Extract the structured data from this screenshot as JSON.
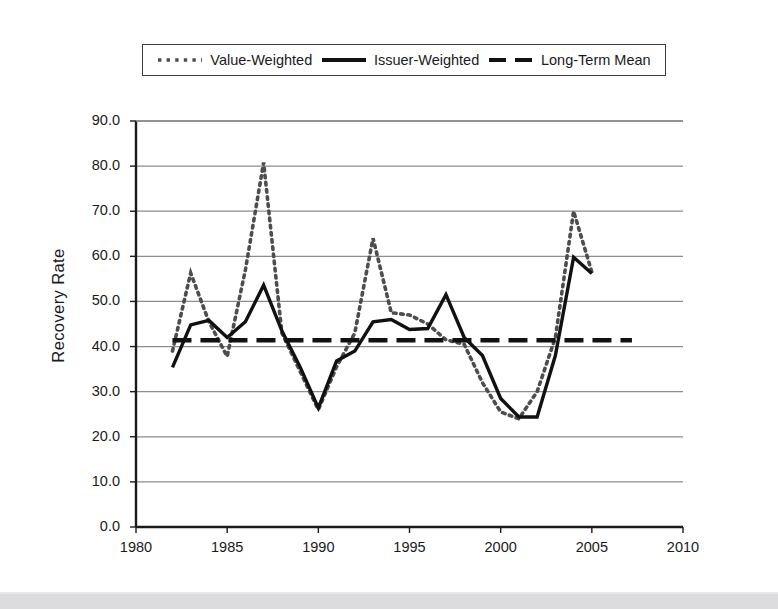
{
  "chart_data": {
    "type": "line",
    "title": "",
    "xlabel": "",
    "ylabel": "Recovery Rate",
    "xlim": [
      1980,
      2010
    ],
    "ylim": [
      0.0,
      90.0
    ],
    "grid": true,
    "legend_position": "top",
    "x_ticks": [
      "1980",
      "1985",
      "1990",
      "1995",
      "2000",
      "2005",
      "2010"
    ],
    "y_ticks": [
      "0.0",
      "10.0",
      "20.0",
      "30.0",
      "40.0",
      "50.0",
      "60.0",
      "70.0",
      "80.0",
      "90.0"
    ],
    "x": [
      1982,
      1983,
      1984,
      1985,
      1986,
      1987,
      1988,
      1989,
      1990,
      1991,
      1992,
      1993,
      1994,
      1995,
      1996,
      1997,
      1998,
      1999,
      2000,
      2001,
      2002,
      2003,
      2004,
      2005
    ],
    "series": [
      {
        "name": "Value-Weighted",
        "style": "dotted",
        "color": "#4d4d4d",
        "values": [
          39.0,
          56.3,
          45.5,
          37.8,
          57.0,
          80.8,
          43.0,
          34.5,
          26.0,
          35.5,
          43.0,
          64.0,
          47.5,
          47.0,
          45.0,
          41.5,
          40.5,
          32.0,
          25.5,
          24.0,
          30.0,
          42.0,
          70.0,
          56.5
        ]
      },
      {
        "name": "Issuer-Weighted",
        "style": "solid",
        "color": "#111111",
        "values": [
          35.4,
          44.8,
          45.8,
          42.0,
          45.5,
          53.6,
          43.5,
          35.5,
          26.4,
          36.8,
          39.0,
          45.5,
          46.0,
          43.8,
          44.0,
          51.5,
          42.0,
          38.0,
          28.5,
          24.4,
          24.4,
          38.0,
          59.8,
          56.2
        ]
      }
    ],
    "reference_line": {
      "name": "Long-Term Mean",
      "style": "dashed",
      "color": "#111111",
      "value": 41.4,
      "x_start": 1982,
      "x_end": 2007.2
    }
  },
  "legend": {
    "items": [
      {
        "label": "Value-Weighted",
        "style": "dotted"
      },
      {
        "label": "Issuer-Weighted",
        "style": "solid"
      },
      {
        "label": "Long-Term Mean",
        "style": "dashed"
      }
    ]
  },
  "axes": {
    "y_title": "Recovery Rate"
  }
}
